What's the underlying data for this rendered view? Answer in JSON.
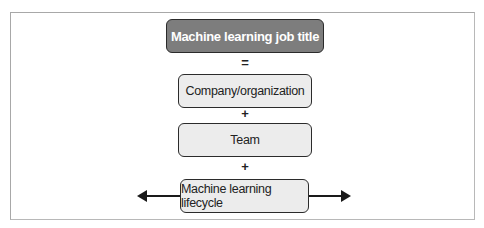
{
  "diagram": {
    "title_box": "Machine learning job title",
    "operators": [
      "=",
      "+",
      "+"
    ],
    "components": [
      "Company/organization",
      "Team",
      "Machine learning lifecycle"
    ],
    "lifecycle_arrows": "bidirectional",
    "colors": {
      "title_fill": "#7d7d7d",
      "component_fill": "#ececec",
      "border": "#2b2b2b"
    }
  }
}
